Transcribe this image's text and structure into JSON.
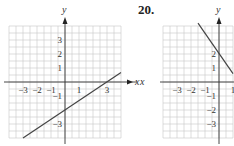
{
  "problem_label": "20.",
  "chart_data": [
    {
      "type": "line",
      "title": "",
      "xlabel": "x",
      "ylabel": "y",
      "xlim": [
        -4,
        4
      ],
      "ylim": [
        -4,
        4
      ],
      "grid": true,
      "x_ticks": [
        "-3",
        "-2",
        "-1",
        "1",
        "3"
      ],
      "x_tick_values": [
        -3,
        -2,
        -1,
        1,
        3
      ],
      "y_ticks": [
        "3",
        "2",
        "1",
        "-1",
        "-3"
      ],
      "y_tick_values": [
        3,
        2,
        1,
        -1,
        -3
      ],
      "series": [
        {
          "name": "line",
          "x": [
            -3,
            4
          ],
          "y": [
            -4,
            0.67
          ]
        }
      ]
    },
    {
      "type": "line",
      "title": "",
      "xlabel": "x",
      "ylabel": "y",
      "xlim": [
        -4,
        1
      ],
      "ylim": [
        -4,
        4
      ],
      "grid": true,
      "x_ticks": [
        "-3",
        "-2",
        "-1",
        "1"
      ],
      "x_tick_values": [
        -3,
        -2,
        -1,
        1
      ],
      "y_ticks": [
        "2",
        "1",
        "-1",
        "-2",
        "-3"
      ],
      "y_tick_values": [
        2,
        1,
        -1,
        -2,
        -3
      ],
      "series": [
        {
          "name": "line",
          "x": [
            -1.5,
            1
          ],
          "y": [
            4.2,
            0.6
          ]
        }
      ]
    }
  ]
}
